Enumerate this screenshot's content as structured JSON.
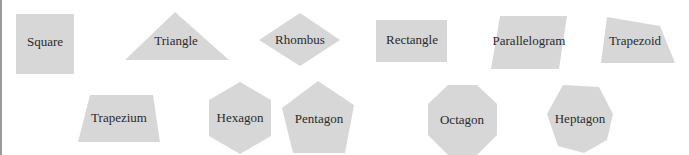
{
  "colors": {
    "shape_fill": "#d7d7d7",
    "label_text": "#2a2a2a",
    "background": "#ffffff",
    "left_rule": "#9a9a9a"
  },
  "shapes": [
    {
      "id": "square",
      "label": "Square"
    },
    {
      "id": "triangle",
      "label": "Triangle"
    },
    {
      "id": "rhombus",
      "label": "Rhombus"
    },
    {
      "id": "rectangle",
      "label": "Rectangle"
    },
    {
      "id": "parallelogram",
      "label": "Parallelogram"
    },
    {
      "id": "trapezoid",
      "label": "Trapezoid"
    },
    {
      "id": "trapezium",
      "label": "Trapezium"
    },
    {
      "id": "hexagon",
      "label": "Hexagon"
    },
    {
      "id": "pentagon",
      "label": "Pentagon"
    },
    {
      "id": "octagon",
      "label": "Octagon"
    },
    {
      "id": "heptagon",
      "label": "Heptagon"
    }
  ]
}
